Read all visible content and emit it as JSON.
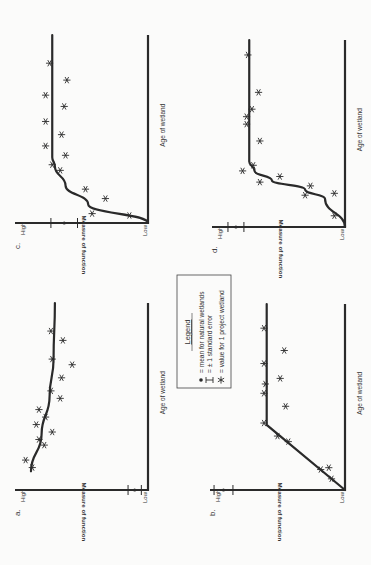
{
  "figure": {
    "orientation": "rotated 90deg counter-clockwise",
    "legend": {
      "title": "Legend",
      "items": [
        {
          "symbol": "dot-icon",
          "text": "= mean for natural wetlands"
        },
        {
          "symbol": "error-bar-icon",
          "text": "= ± 1 standard error"
        },
        {
          "symbol": "asterisk-icon",
          "text": "= value for 1 project wetland"
        }
      ]
    },
    "axis": {
      "ylabel": "Measure of function",
      "xlabel": "Age of wetland",
      "high": "High",
      "low": "Low"
    },
    "panels": [
      {
        "id": "a",
        "label": "a."
      },
      {
        "id": "b",
        "label": "b."
      },
      {
        "id": "c",
        "label": "c."
      },
      {
        "id": "d",
        "label": "d."
      }
    ]
  },
  "chart_data": [
    {
      "panel": "a",
      "type": "scatter",
      "title": "a.",
      "xlabel": "Age of wetland",
      "ylabel": "Measure of function",
      "ytick_labels": [
        "Low",
        "High"
      ],
      "natural_mean": 0.1,
      "natural_se": 0.05,
      "trend": "declining curve from high toward moderate-high",
      "trend_line": {
        "x": [
          0.1,
          0.3,
          0.5,
          0.7,
          1.0
        ],
        "y": [
          0.88,
          0.8,
          0.74,
          0.71,
          0.7
        ]
      },
      "project_values": {
        "x": [
          0.12,
          0.16,
          0.24,
          0.27,
          0.31,
          0.35,
          0.39,
          0.43,
          0.49,
          0.53,
          0.6,
          0.67,
          0.7,
          0.8,
          0.85
        ],
        "y": [
          0.87,
          0.92,
          0.78,
          0.82,
          0.72,
          0.84,
          0.77,
          0.82,
          0.66,
          0.73,
          0.65,
          0.57,
          0.72,
          0.64,
          0.73
        ]
      }
    },
    {
      "panel": "b",
      "type": "scatter",
      "title": "b.",
      "xlabel": "Age of wetland",
      "ylabel": "Measure of function",
      "ytick_labels": [
        "Low",
        "High"
      ],
      "natural_mean": 0.9,
      "natural_se": 0.07,
      "trend": "linear rise then plateau",
      "trend_line": {
        "x": [
          0.0,
          0.35,
          1.0
        ],
        "y": [
          0.0,
          0.58,
          0.58
        ]
      },
      "project_values": {
        "x": [
          0.06,
          0.11,
          0.12,
          0.26,
          0.29,
          0.36,
          0.45,
          0.52,
          0.57,
          0.6,
          0.68,
          0.75,
          0.87
        ],
        "y": [
          0.1,
          0.18,
          0.12,
          0.42,
          0.5,
          0.6,
          0.44,
          0.6,
          0.59,
          0.48,
          0.6,
          0.45,
          0.6
        ]
      }
    },
    {
      "panel": "c",
      "type": "scatter",
      "title": "c.",
      "xlabel": "Age of wetland",
      "ylabel": "Measure of function",
      "ytick_labels": [
        "Low",
        "High"
      ],
      "natural_mean": 0.63,
      "natural_se": 0.1,
      "trend": "rapid rise (saturating) then plateau",
      "trend_line": {
        "x": [
          0.0,
          0.1,
          0.2,
          0.3,
          0.35,
          1.0
        ],
        "y": [
          0.0,
          0.45,
          0.62,
          0.7,
          0.72,
          0.72
        ]
      },
      "project_values": {
        "x": [
          0.04,
          0.05,
          0.13,
          0.18,
          0.28,
          0.31,
          0.36,
          0.41,
          0.47,
          0.54,
          0.62,
          0.68,
          0.76,
          0.85
        ],
        "y": [
          0.14,
          0.42,
          0.32,
          0.47,
          0.66,
          0.72,
          0.62,
          0.77,
          0.65,
          0.77,
          0.63,
          0.77,
          0.61,
          0.74
        ]
      }
    },
    {
      "panel": "d",
      "type": "scatter",
      "title": "d.",
      "xlabel": "Age of wetland",
      "ylabel": "Measure of function",
      "ytick_labels": [
        "Low",
        "High"
      ],
      "natural_mean": 0.82,
      "natural_se": 0.06,
      "trend": "sigmoid: slow start, sharp rise, plateau",
      "trend_line": {
        "x": [
          0.0,
          0.15,
          0.2,
          0.25,
          0.3,
          0.35,
          1.0
        ],
        "y": [
          0.0,
          0.15,
          0.3,
          0.55,
          0.68,
          0.72,
          0.72
        ]
      },
      "project_values": {
        "x": [
          0.06,
          0.17,
          0.18,
          0.22,
          0.24,
          0.27,
          0.3,
          0.33,
          0.46,
          0.55,
          0.59,
          0.63,
          0.72,
          0.92
        ],
        "y": [
          0.08,
          0.3,
          0.08,
          0.26,
          0.64,
          0.49,
          0.77,
          0.69,
          0.64,
          0.74,
          0.74,
          0.7,
          0.65,
          0.73
        ]
      }
    }
  ]
}
